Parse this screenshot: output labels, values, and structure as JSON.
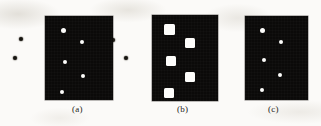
{
  "figure": {
    "width": 321,
    "height": 126,
    "background_color": "#fbfaf8",
    "panel_color": "#0b0a09",
    "foreground_color": "#fdfdfb",
    "stray_dot_color": "#16140f"
  },
  "panels": [
    {
      "id": "panel-a",
      "caption": "(a)",
      "caption_x": 72,
      "caption_y": 104,
      "x": 45,
      "y": 16,
      "width": 68,
      "height": 84,
      "marker_shape": "circle",
      "marker_size": 4,
      "markers": [
        {
          "cx": 18,
          "cy": 14,
          "size": 5
        },
        {
          "cx": 37,
          "cy": 26,
          "size": 4
        },
        {
          "cx": 20,
          "cy": 46,
          "size": 4
        },
        {
          "cx": 38,
          "cy": 60,
          "size": 4
        },
        {
          "cx": 17,
          "cy": 76,
          "size": 4
        }
      ]
    },
    {
      "id": "panel-b",
      "caption": "(b)",
      "caption_x": 177,
      "caption_y": 104,
      "x": 152,
      "y": 15,
      "width": 66,
      "height": 86,
      "marker_shape": "square",
      "marker_size": 10,
      "markers": [
        {
          "cx": 17,
          "cy": 14,
          "size": 11
        },
        {
          "cx": 38,
          "cy": 28,
          "size": 10
        },
        {
          "cx": 19,
          "cy": 46,
          "size": 10
        },
        {
          "cx": 38,
          "cy": 62,
          "size": 10
        },
        {
          "cx": 17,
          "cy": 78,
          "size": 10
        }
      ]
    },
    {
      "id": "panel-c",
      "caption": "(c)",
      "caption_x": 268,
      "caption_y": 104,
      "x": 245,
      "y": 16,
      "width": 63,
      "height": 84,
      "marker_shape": "circle",
      "marker_size": 4,
      "markers": [
        {
          "cx": 17,
          "cy": 14,
          "size": 5
        },
        {
          "cx": 36,
          "cy": 26,
          "size": 4
        },
        {
          "cx": 19,
          "cy": 44,
          "size": 4
        },
        {
          "cx": 35,
          "cy": 59,
          "size": 4
        },
        {
          "cx": 17,
          "cy": 74,
          "size": 4
        }
      ]
    }
  ],
  "stray_dots": [
    {
      "cx": 21,
      "cy": 39,
      "size": 4
    },
    {
      "cx": 15,
      "cy": 58,
      "size": 4
    },
    {
      "cx": 113,
      "cy": 40,
      "size": 4
    },
    {
      "cx": 126,
      "cy": 58,
      "size": 4
    }
  ]
}
